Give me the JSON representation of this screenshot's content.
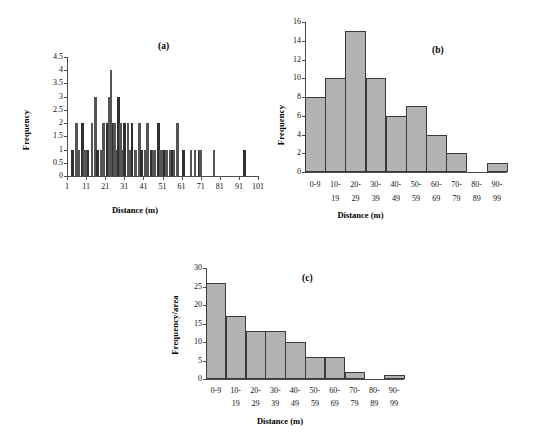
{
  "figure": {
    "panels": [
      {
        "id": "a",
        "label": "(a)",
        "xlabel": "Distance (m)",
        "ylabel": "Frequency"
      },
      {
        "id": "b",
        "label": "(b)",
        "xlabel": "Distance (m)",
        "ylabel": "Frequency"
      },
      {
        "id": "c",
        "label": "(c)",
        "xlabel": "Distance (m)",
        "ylabel": "Frequency/area"
      }
    ]
  },
  "chart_data": [
    {
      "type": "bar",
      "panel": "a",
      "title": "(a)",
      "xlabel": "Distance (m)",
      "ylabel": "Frequency",
      "xlim": [
        1,
        101
      ],
      "ylim": [
        0,
        4.5
      ],
      "xticks": [
        1,
        11,
        21,
        31,
        41,
        51,
        61,
        71,
        81,
        91,
        101
      ],
      "yticks": [
        0,
        0.5,
        1,
        1.5,
        2,
        2.5,
        3,
        3.5,
        4,
        4.5
      ],
      "xtick_labels": [
        "1",
        "11",
        "21",
        "31",
        "41",
        "51",
        "61",
        "71",
        "81",
        "91",
        "101"
      ],
      "ytick_labels": [
        "0",
        "0.5",
        "1",
        "1.5",
        "2",
        "2.5",
        "3",
        "3.5",
        "4",
        "4.5"
      ],
      "grid": false,
      "legend": null,
      "note": "Individual-distance frequency spikes; x is distance in m, y is count at that distance",
      "x": [
        4,
        6,
        7,
        9,
        10,
        11,
        12,
        14,
        16,
        17,
        19,
        20,
        22,
        23,
        24,
        25,
        26,
        27,
        28,
        29,
        30,
        31,
        33,
        34,
        35,
        37,
        39,
        40,
        42,
        43,
        45,
        46,
        47,
        49,
        50,
        51,
        52,
        53,
        55,
        56,
        57,
        59,
        62,
        66,
        68,
        70,
        71,
        78,
        94
      ],
      "values": [
        1,
        2,
        1,
        2,
        1,
        1,
        1,
        2,
        3,
        1,
        1,
        2,
        2,
        3,
        4,
        2,
        2,
        1,
        3,
        2,
        1,
        2,
        2,
        1,
        2,
        1,
        2,
        1,
        1,
        2,
        1,
        1,
        1,
        2,
        1,
        1,
        1,
        1,
        1,
        1,
        1,
        2,
        1,
        1,
        1,
        1,
        1,
        1,
        1
      ]
    },
    {
      "type": "bar",
      "panel": "b",
      "title": "(b)",
      "xlabel": "Distance (m)",
      "ylabel": "Frequency",
      "ylim": [
        0,
        16
      ],
      "yticks": [
        0,
        2,
        4,
        6,
        8,
        10,
        12,
        14,
        16
      ],
      "ytick_labels": [
        "0",
        "2",
        "4",
        "6",
        "8",
        "10",
        "12",
        "14",
        "16"
      ],
      "categories": [
        "0-9",
        "10-\n19",
        "20-\n29",
        "30-\n39",
        "40-\n49",
        "50-\n59",
        "60-\n69",
        "70-\n79",
        "80-\n89",
        "90-\n99"
      ],
      "category_top": [
        "0-9",
        "10-",
        "20-",
        "30-",
        "40-",
        "50-",
        "60-",
        "70-",
        "80-",
        "90-"
      ],
      "category_bottom": [
        "",
        "19",
        "29",
        "39",
        "49",
        "59",
        "69",
        "79",
        "89",
        "99"
      ],
      "values": [
        8,
        10,
        15,
        10,
        6,
        7,
        4,
        2,
        0,
        1
      ],
      "grid": false,
      "legend": null,
      "bar_fill": "#b3b3b3",
      "bar_edge": "#3a3a3a"
    },
    {
      "type": "bar",
      "panel": "c",
      "title": "(c)",
      "xlabel": "Distance (m)",
      "ylabel": "Frequency/area",
      "ylim": [
        0,
        30
      ],
      "yticks": [
        0,
        5,
        10,
        15,
        20,
        25,
        30
      ],
      "ytick_labels": [
        "0",
        "5",
        "10",
        "15",
        "20",
        "25",
        "30"
      ],
      "categories": [
        "0-9",
        "10-\n19",
        "20-\n29",
        "30-\n39",
        "40-\n49",
        "50-\n59",
        "60-\n69",
        "70-\n79",
        "80-\n89",
        "90-\n99"
      ],
      "category_top": [
        "0-9",
        "10-",
        "20-",
        "30-",
        "40-",
        "50-",
        "60-",
        "70-",
        "80-",
        "90-"
      ],
      "category_bottom": [
        "",
        "19",
        "29",
        "39",
        "49",
        "59",
        "69",
        "79",
        "89",
        "99"
      ],
      "values": [
        26,
        17,
        13,
        13,
        10,
        6,
        6,
        2,
        0,
        1
      ],
      "grid": false,
      "legend": null,
      "bar_fill": "#b3b3b3",
      "bar_edge": "#3a3a3a"
    }
  ]
}
